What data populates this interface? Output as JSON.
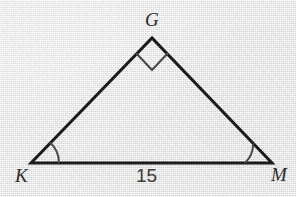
{
  "figure": {
    "kind": "geometry-diagram",
    "shape": "right-triangle",
    "background_color": "#ebebeb",
    "stroke_color": "#1b1b1b",
    "marker_color": "#4a4a4a",
    "label_color": "#2b2b2b",
    "vertices": [
      {
        "name": "G",
        "label": "G",
        "x": 152,
        "y": 38,
        "role": "apex-right-angle"
      },
      {
        "name": "K",
        "label": "K",
        "x": 31,
        "y": 163,
        "role": "base-left"
      },
      {
        "name": "M",
        "label": "M",
        "x": 272,
        "y": 163,
        "role": "base-right"
      }
    ],
    "sides": [
      {
        "name": "KG",
        "from": "K",
        "to": "G",
        "label": ""
      },
      {
        "name": "GM",
        "from": "G",
        "to": "M",
        "label": ""
      },
      {
        "name": "KM",
        "from": "K",
        "to": "M",
        "label": "15"
      }
    ],
    "angle_marks": [
      {
        "at": "G",
        "type": "right-angle-square",
        "size": 22
      },
      {
        "at": "K",
        "type": "arc",
        "radius": 28
      },
      {
        "at": "M",
        "type": "arc",
        "radius": 27
      }
    ],
    "labels": {
      "apex": "G",
      "base_left": "K",
      "base_right": "M",
      "base_length": "15"
    }
  }
}
